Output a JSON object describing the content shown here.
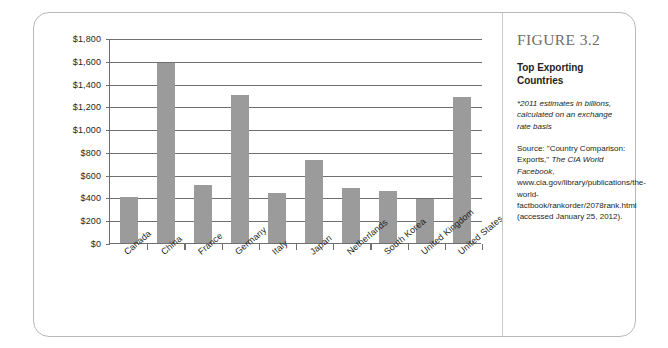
{
  "figure": {
    "number_label": "FIGURE 3.2",
    "title": "Top Exporting Countries",
    "note": "*2011 estimates in billions, calculated on an exchange rate basis",
    "source_prefix": "Source: \"Country Comparison: Exports,\" ",
    "source_italic": "The CIA World Facebook",
    "source_suffix": ", www.cia.gov/library/publications/the-world-factbook/rankorder/2078rank.html (accessed January 25, 2012).",
    "border_color": "#b9b9b9"
  },
  "chart_data": {
    "type": "bar",
    "title": "Top Exporting Countries",
    "xlabel": "",
    "ylabel": "",
    "ylim": [
      0,
      1800
    ],
    "grid": true,
    "legend": "none",
    "bar_color": "#9b9b9b",
    "axis_color": "#6f6f6f",
    "y_tick_labels": [
      "$1,800",
      "$1,600",
      "$1,400",
      "$1,200",
      "$1,000",
      "$800",
      "$600",
      "$400",
      "$200",
      "$0"
    ],
    "y_tick_values": [
      1800,
      1600,
      1400,
      1200,
      1000,
      800,
      600,
      400,
      200,
      0
    ],
    "categories": [
      "Canada",
      "China",
      "France",
      "Germany",
      "Italy",
      "Japan",
      "Netherlands",
      "South Korea",
      "United Kingdom",
      "United States"
    ],
    "values": [
      400,
      1580,
      510,
      1300,
      440,
      730,
      480,
      460,
      390,
      1280
    ]
  }
}
